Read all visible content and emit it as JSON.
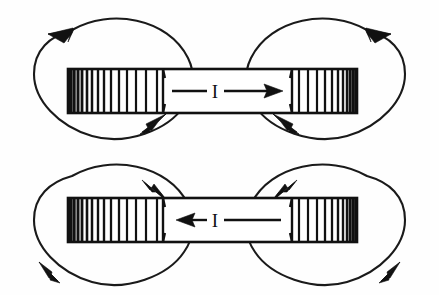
{
  "figure": {
    "background_color": "#fefefe",
    "ink_color": "#111111",
    "width": 439,
    "height": 295,
    "panels": [
      {
        "id": "top-panel",
        "name": "solenoid-current-right",
        "current_label": "I",
        "current_direction": "right",
        "field_circulation": "counterclockwise-left-loop-clockwise-right-loop",
        "solenoid": {
          "x": 68,
          "y": 69,
          "width": 289,
          "height": 44,
          "left_winding_end": 163,
          "right_winding_start": 292,
          "left_coil_turns": 17,
          "right_coil_turns": 17,
          "dense_side_left": "left",
          "dense_side_right": "right"
        },
        "current_arrow": {
          "shaft_start_x": 172,
          "shaft_end_x": 280,
          "y": 91,
          "head_direction": "right",
          "label_x": 214,
          "label_y": 97
        },
        "loops": [
          {
            "id": "top-left-loop",
            "cx": 117,
            "cy": 74,
            "rx": 86,
            "ry": 66,
            "arrow_positions": [
              "top-left",
              "bottom-right"
            ],
            "arrow_directions": [
              "left",
              "up-right"
            ]
          },
          {
            "id": "top-right-loop",
            "cx": 322,
            "cy": 74,
            "rx": 86,
            "ry": 66,
            "arrow_positions": [
              "top-right",
              "bottom-left"
            ],
            "arrow_directions": [
              "right",
              "up-left"
            ]
          }
        ]
      },
      {
        "id": "bottom-panel",
        "name": "solenoid-current-left",
        "current_label": "I",
        "current_direction": "left",
        "field_circulation": "clockwise-left-loop-counterclockwise-right-loop",
        "solenoid": {
          "x": 68,
          "y": 198,
          "width": 289,
          "height": 44,
          "left_winding_end": 163,
          "right_winding_start": 292,
          "left_coil_turns": 17,
          "right_coil_turns": 17,
          "dense_side_left": "left",
          "dense_side_right": "right"
        },
        "current_arrow": {
          "shaft_start_x": 172,
          "shaft_end_x": 280,
          "y": 220,
          "head_direction": "left",
          "label_x": 214,
          "label_y": 226
        },
        "loops": [
          {
            "id": "bottom-left-loop",
            "cx": 117,
            "cy": 220,
            "rx": 86,
            "ry": 66,
            "arrow_positions": [
              "top-right",
              "bottom-left"
            ],
            "arrow_directions": [
              "down-right",
              "left"
            ]
          },
          {
            "id": "bottom-right-loop",
            "cx": 322,
            "cy": 220,
            "rx": 86,
            "ry": 66,
            "arrow_positions": [
              "top-left",
              "bottom-right"
            ],
            "arrow_directions": [
              "down-left",
              "right"
            ]
          }
        ]
      }
    ]
  }
}
